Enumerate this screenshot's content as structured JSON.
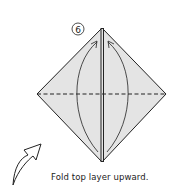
{
  "diagram": {
    "step_number": "6",
    "caption": "Fold top layer upward.",
    "colors": {
      "paper": "#e4e4e4",
      "line": "#222222",
      "background": "#ffffff"
    },
    "elements": [
      "diamond-paper",
      "center-crease",
      "horizontal-valley-fold-line",
      "left-curved-arrow",
      "right-curved-arrow",
      "turn-over-arrow"
    ]
  }
}
